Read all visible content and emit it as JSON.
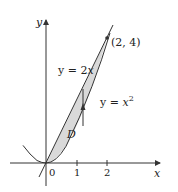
{
  "figure": {
    "axes": {
      "x_label": "x",
      "y_label": "y",
      "x_ticks": [
        "0",
        "1",
        "2"
      ]
    },
    "curves": [
      {
        "name": "line",
        "equation_label_prefix": "y = 2",
        "equation_var": "x"
      },
      {
        "name": "parabola",
        "equation_label_prefix": "y = ",
        "equation_var": "x",
        "exponent": "2"
      }
    ],
    "intersection_point": "(2, 4)",
    "region_label": "D",
    "colors": {
      "region_fill": "#d9d9d9",
      "stroke": "#333333"
    }
  }
}
